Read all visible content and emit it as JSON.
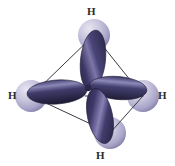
{
  "figure": {
    "background_color": "#ffffff",
    "width": 175,
    "height": 166,
    "colors": {
      "lobe_dark": "#2e2a52",
      "lobe_mid": "#4a4578",
      "lobe_highlight": "#9e9ac4",
      "sphere_light": "#d6d3e6",
      "sphere_mid": "#b3afd0",
      "sphere_dark": "#7d79a4",
      "wireframe": "#3a3a46",
      "label_color": "#2b2b2b"
    },
    "labels": {
      "top": "H",
      "left": "H",
      "right": "H",
      "bottom": "H"
    },
    "atoms": [
      {
        "name": "hydrogen-top",
        "element": "H",
        "cx": 94,
        "cy": 35,
        "r": 16
      },
      {
        "name": "hydrogen-left",
        "element": "H",
        "cx": 31,
        "cy": 96,
        "r": 16
      },
      {
        "name": "hydrogen-right",
        "element": "H",
        "cx": 143,
        "cy": 96,
        "r": 16
      },
      {
        "name": "hydrogen-bottom",
        "element": "H",
        "cx": 110,
        "cy": 133,
        "r": 16
      }
    ],
    "center": {
      "x": 87,
      "y": 88
    },
    "orbitals": [
      {
        "name": "sp3-lobe-up",
        "direction": "up-right"
      },
      {
        "name": "sp3-lobe-left",
        "direction": "left"
      },
      {
        "name": "sp3-lobe-right",
        "direction": "right"
      },
      {
        "name": "sp3-lobe-down",
        "direction": "down-right"
      }
    ],
    "tetrahedron_edges": [
      [
        "hydrogen-top",
        "hydrogen-left"
      ],
      [
        "hydrogen-top",
        "hydrogen-right"
      ],
      [
        "hydrogen-top",
        "hydrogen-bottom"
      ],
      [
        "hydrogen-left",
        "hydrogen-right"
      ],
      [
        "hydrogen-left",
        "hydrogen-bottom"
      ],
      [
        "hydrogen-right",
        "hydrogen-bottom"
      ]
    ]
  }
}
